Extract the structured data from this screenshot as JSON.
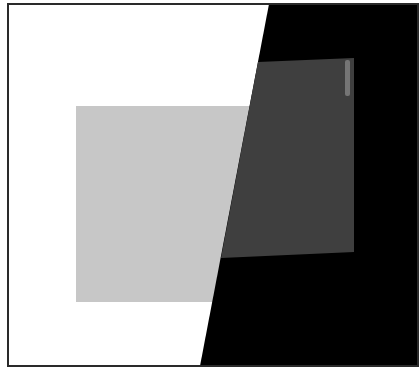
{
  "artwork": {
    "width": 419,
    "height": 371,
    "colors": {
      "background": "#ffffff",
      "frame": "#2a2a2a",
      "light_gray": "#c7c7c7",
      "dark_gray": "#3f3f3f",
      "black": "#000000",
      "highlight": "#9a9a9a"
    },
    "frame": {
      "x": 8,
      "y": 4,
      "width": 410,
      "height": 362
    },
    "light_gray_rect": {
      "x": 76,
      "y": 106,
      "width": 180,
      "height": 196
    },
    "black_region_points": "269,4 418,4 418,366 200,366",
    "dark_gray_quad_points": "258,62 354,58 354,252 221,258",
    "highlight_streak": {
      "x": 345,
      "y": 60,
      "width": 5,
      "height": 36
    }
  }
}
